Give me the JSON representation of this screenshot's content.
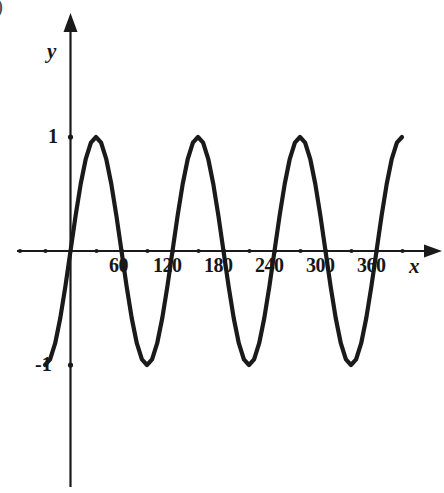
{
  "corner_mark": ")",
  "axes": {
    "x_axis_label": "x",
    "y_axis_label": "y",
    "x_tick_labels": [
      "60",
      "120",
      "180",
      "240",
      "300",
      "360"
    ],
    "y_tick_labels": [
      "1",
      "-1"
    ]
  },
  "chart_data": {
    "type": "line",
    "title": "",
    "subtitle": "",
    "xlabel": "x",
    "ylabel": "y",
    "function": "y = sin(3x)",
    "grid": false,
    "legend": null,
    "xlim": [
      -30,
      390
    ],
    "ylim": [
      -1.55,
      2.05
    ],
    "x_ticks": [
      60,
      120,
      180,
      240,
      300,
      360
    ],
    "x_tick_labels": [
      "60",
      "120",
      "180",
      "240",
      "300",
      "360"
    ],
    "y_ticks": [
      1,
      -1
    ],
    "y_tick_labels": [
      "1",
      "-1"
    ],
    "period_degrees": 120,
    "amplitude": 1,
    "peaks_x": [
      30,
      150,
      270,
      390
    ],
    "troughs_x": [
      -30,
      90,
      210,
      330
    ],
    "zeros_x": [
      0,
      60,
      120,
      180,
      240,
      300,
      360
    ],
    "x": [
      -30,
      -24,
      -18,
      -12,
      -6,
      0,
      6,
      12,
      18,
      24,
      30,
      36,
      42,
      48,
      54,
      60,
      66,
      72,
      78,
      84,
      90,
      96,
      102,
      108,
      114,
      120,
      126,
      132,
      138,
      144,
      150,
      156,
      162,
      168,
      174,
      180,
      186,
      192,
      198,
      204,
      210,
      216,
      222,
      228,
      234,
      240,
      246,
      252,
      258,
      264,
      270,
      276,
      282,
      288,
      294,
      300,
      306,
      312,
      318,
      324,
      330,
      336,
      342,
      348,
      354,
      360,
      366,
      372,
      378,
      384,
      390
    ],
    "y": [
      -1,
      -0.951,
      -0.809,
      -0.588,
      -0.309,
      0,
      0.309,
      0.588,
      0.809,
      0.951,
      1,
      0.951,
      0.809,
      0.588,
      0.309,
      0,
      -0.309,
      -0.588,
      -0.809,
      -0.951,
      -1,
      -0.951,
      -0.809,
      -0.588,
      -0.309,
      0,
      0.309,
      0.588,
      0.809,
      0.951,
      1,
      0.951,
      0.809,
      0.588,
      0.309,
      0,
      -0.309,
      -0.588,
      -0.809,
      -0.951,
      -1,
      -0.951,
      -0.809,
      -0.588,
      -0.309,
      0,
      0.309,
      0.588,
      0.809,
      0.951,
      1,
      0.951,
      0.809,
      0.588,
      0.309,
      0,
      -0.309,
      -0.588,
      -0.809,
      -0.951,
      -1,
      -0.951,
      -0.809,
      -0.588,
      -0.309,
      0,
      0.309,
      0.588,
      0.809,
      0.951,
      1
    ],
    "colors": {
      "curve": "#1a1a1a",
      "axis": "#1a1a1a",
      "background": "#ffffff"
    }
  }
}
